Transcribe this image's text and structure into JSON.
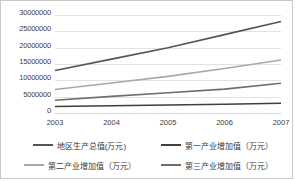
{
  "chart_data": {
    "type": "line",
    "title": "",
    "xlabel": "",
    "ylabel": "",
    "categories": [
      "2003",
      "2004",
      "2005",
      "2006",
      "2007"
    ],
    "x": [
      2003,
      2004,
      2005,
      2006,
      2007
    ],
    "ylim": [
      0,
      30000000
    ],
    "yticks": [
      0,
      5000000,
      10000000,
      15000000,
      20000000,
      25000000,
      30000000
    ],
    "ytick_labels": [
      "0",
      "5000000",
      "10000000",
      "15000000",
      "20000000",
      "25000000",
      "30000000"
    ],
    "grid": true,
    "legend_position": "bottom",
    "series": [
      {
        "name": "地区生产总值(万元)",
        "color": "#555555",
        "values": [
          13000000,
          16500000,
          20000000,
          24000000,
          28000000
        ]
      },
      {
        "name": "第一产业增加值（万元）",
        "color": "#3f3f3f",
        "values": [
          2000000,
          2200000,
          2450000,
          2700000,
          3000000
        ]
      },
      {
        "name": "第二产业增加值（万元）",
        "color": "#a8a8a8",
        "values": [
          7200000,
          9200000,
          11200000,
          13600000,
          16200000
        ]
      },
      {
        "name": "第三产业增加值（万元）",
        "color": "#6e6e6e",
        "values": [
          3900000,
          5100000,
          6200000,
          7300000,
          9100000
        ]
      }
    ]
  },
  "legend": {
    "items": [
      {
        "label": "地区生产总值(万元)",
        "color": "#555555",
        "swatch": "line-marker-icon"
      },
      {
        "label": "第一产业增加值（万元）",
        "color": "#3f3f3f",
        "swatch": "line-marker-icon"
      },
      {
        "label": "第二产业增加值（万元）",
        "color": "#a8a8a8",
        "swatch": "line-marker-icon"
      },
      {
        "label": "第三产业增加值（万元）",
        "color": "#6e6e6e",
        "swatch": "line-marker-icon"
      }
    ]
  }
}
